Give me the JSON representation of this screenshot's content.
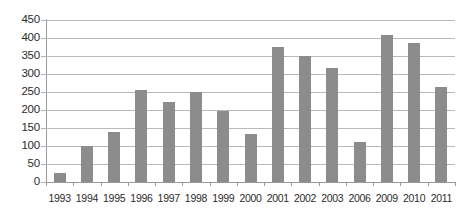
{
  "chart_data": {
    "type": "bar",
    "title": "",
    "subtitle": "",
    "xlabel": "",
    "ylabel": "",
    "categories": [
      "1993",
      "1994",
      "1995",
      "1996",
      "1997",
      "1998",
      "1999",
      "2000",
      "2001",
      "2002",
      "2003",
      "2006",
      "2009",
      "2010",
      "2011"
    ],
    "values": [
      25,
      100,
      140,
      255,
      222,
      250,
      198,
      133,
      375,
      350,
      318,
      112,
      408,
      385,
      263
    ],
    "ylim": [
      0,
      450
    ],
    "ytick_labels": [
      "450",
      "400",
      "350",
      "300",
      "250",
      "200",
      "150",
      "100",
      "50",
      "0"
    ],
    "ytick_values": [
      450,
      400,
      350,
      300,
      250,
      200,
      150,
      100,
      50,
      0
    ],
    "ytick_step": 50,
    "grid": true,
    "legend": false,
    "legend_position": "none",
    "bar_color": "#8c8c8c",
    "gridline_color": "#b9b9b9",
    "axis_color": "#9a9a9a",
    "background_color": "#ffffff",
    "text_color": "#2b2b2b"
  }
}
